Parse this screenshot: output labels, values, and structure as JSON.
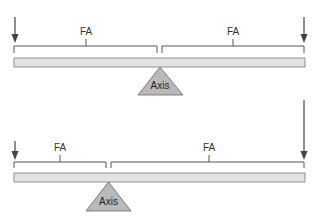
{
  "colors": {
    "line": "#555555",
    "beam_fill": "#e3e3e3",
    "beam_stroke": "#777777",
    "fulcrum_fill": "#b9b9b9",
    "arrow": "#444444"
  },
  "diagrams": [
    {
      "id": "balanced-lever",
      "force_arm_left": {
        "label": "FA"
      },
      "force_arm_right": {
        "label": "FA"
      },
      "fulcrum": {
        "label": "Axis"
      },
      "arrows": {
        "left": "short",
        "right": "short"
      }
    },
    {
      "id": "unbalanced-lever",
      "force_arm_left": {
        "label": "FA"
      },
      "force_arm_right": {
        "label": "FA"
      },
      "fulcrum": {
        "label": "Axis"
      },
      "arrows": {
        "left": "short",
        "right": "long"
      }
    }
  ]
}
